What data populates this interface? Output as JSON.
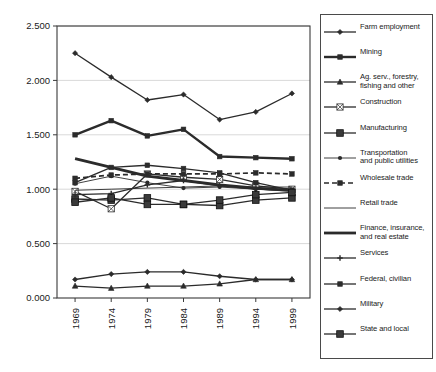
{
  "chart_data": {
    "type": "line",
    "title": "",
    "xlabel": "",
    "ylabel": "",
    "x": [
      "1969",
      "1974",
      "1979",
      "1984",
      "1989",
      "1994",
      "1999"
    ],
    "categories": [
      "1969",
      "1974",
      "1979",
      "1984",
      "1989",
      "1994",
      "1999"
    ],
    "ylim": [
      0.0,
      2.5
    ],
    "ytick_labels": [
      "0.000",
      "0.500",
      "1.000",
      "1.500",
      "2.000",
      "2.500"
    ],
    "ytick_values": [
      0.0,
      0.5,
      1.0,
      1.5,
      2.0,
      2.5
    ],
    "grid": true,
    "legend_position": "right",
    "series": [
      {
        "name": "Farm employment",
        "marker": "diamond",
        "line": "solid",
        "values": [
          2.25,
          2.03,
          1.82,
          1.87,
          1.64,
          1.71,
          1.88
        ]
      },
      {
        "name": "Mining",
        "marker": "square",
        "line": "solid-thick",
        "values": [
          1.5,
          1.63,
          1.49,
          1.55,
          1.3,
          1.29,
          1.28
        ]
      },
      {
        "name": "Ag. serv., forestry, fishing and other",
        "marker": "triangle",
        "line": "solid",
        "values": [
          0.11,
          0.09,
          0.11,
          0.11,
          0.13,
          0.17,
          0.17
        ]
      },
      {
        "name": "Construction",
        "marker": "open-x",
        "line": "solid",
        "values": [
          0.98,
          0.82,
          1.14,
          1.11,
          1.09,
          1.03,
          1.0
        ]
      },
      {
        "name": "Manufacturing",
        "marker": "big-square",
        "line": "solid",
        "values": [
          0.91,
          0.9,
          0.92,
          0.86,
          0.85,
          0.9,
          0.92
        ]
      },
      {
        "name": "Transportation and public utilities",
        "marker": "dot",
        "line": "thin",
        "values": [
          1.05,
          1.12,
          1.06,
          1.01,
          1.02,
          1.0,
          0.98
        ]
      },
      {
        "name": "Wholesale trade",
        "marker": "square",
        "line": "dashed",
        "values": [
          1.1,
          1.13,
          1.14,
          1.14,
          1.14,
          1.15,
          1.14
        ]
      },
      {
        "name": "Retail trade",
        "marker": "none",
        "line": "thin",
        "values": [
          0.99,
          1.0,
          1.01,
          1.02,
          1.03,
          1.02,
          1.02
        ]
      },
      {
        "name": "Finance, insurance, and real estate",
        "marker": "none",
        "line": "heavy",
        "values": [
          1.28,
          1.2,
          1.12,
          1.08,
          1.04,
          1.01,
          0.99
        ]
      },
      {
        "name": "Services",
        "marker": "cross",
        "line": "solid",
        "values": [
          0.95,
          0.96,
          1.04,
          1.08,
          1.03,
          1.0,
          0.99
        ]
      },
      {
        "name": "Federal, civilian",
        "marker": "square",
        "line": "solid",
        "values": [
          1.06,
          1.2,
          1.22,
          1.19,
          1.15,
          1.06,
          0.99
        ]
      },
      {
        "name": "Military",
        "marker": "diamond",
        "line": "solid",
        "values": [
          0.17,
          0.22,
          0.24,
          0.24,
          0.2,
          0.17,
          0.17
        ]
      },
      {
        "name": "State and local",
        "marker": "big-square",
        "line": "solid",
        "values": [
          0.88,
          0.92,
          0.86,
          0.86,
          0.9,
          0.95,
          0.97
        ]
      }
    ]
  },
  "axis": {
    "y_labels": [
      "2.500",
      "2.000",
      "1.500",
      "1.000",
      "0.500",
      "0.000"
    ],
    "x_labels": [
      "1969",
      "1974",
      "1979",
      "1984",
      "1989",
      "1994",
      "1999"
    ]
  },
  "legend": {
    "items": [
      {
        "label_line1": "Farm employment",
        "label_line2": ""
      },
      {
        "label_line1": "Mining",
        "label_line2": ""
      },
      {
        "label_line1": "Ag. serv., forestry,",
        "label_line2": "fishing and other"
      },
      {
        "label_line1": "Construction",
        "label_line2": ""
      },
      {
        "label_line1": "Manufacturing",
        "label_line2": ""
      },
      {
        "label_line1": "Transportation",
        "label_line2": "and public utilities"
      },
      {
        "label_line1": "Wholesale trade",
        "label_line2": ""
      },
      {
        "label_line1": "Retail trade",
        "label_line2": ""
      },
      {
        "label_line1": "Finance, insurance,",
        "label_line2": "and real estate"
      },
      {
        "label_line1": "Services",
        "label_line2": ""
      },
      {
        "label_line1": "Federal, civilian",
        "label_line2": ""
      },
      {
        "label_line1": "Military",
        "label_line2": ""
      },
      {
        "label_line1": "State and local",
        "label_line2": ""
      }
    ]
  },
  "colors": {
    "line": "#2b2b2b",
    "grid": "#c9c9c9",
    "axis": "#3a3a3a",
    "background": "#ffffff"
  }
}
